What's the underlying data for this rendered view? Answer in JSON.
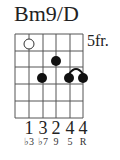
{
  "chord": {
    "name": "Bm9/D",
    "fret_label": "5fr."
  },
  "diagram": {
    "strings": 6,
    "frets_shown": 5,
    "open_marker": {
      "string": 2,
      "fret": 1,
      "style": "hollow"
    },
    "dots": [
      {
        "string": 2,
        "fret": 3
      },
      {
        "string": 3,
        "fret": 2
      },
      {
        "string": 4,
        "fret": 3
      },
      {
        "string": 5,
        "fret": 3
      }
    ],
    "barre": {
      "from_string": 4,
      "to_string": 5,
      "fret": 3
    }
  },
  "fingers": [
    "1",
    "3",
    "2",
    "4",
    "4"
  ],
  "intervals": [
    "♭3",
    "♭7",
    "9",
    "5",
    "R"
  ]
}
